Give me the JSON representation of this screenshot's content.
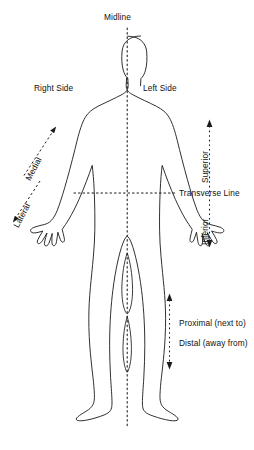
{
  "diagram": {
    "labels": {
      "midline": "Midline",
      "right_side": "Right Side",
      "left_side": "Left Side",
      "medial": "Medial",
      "lateral": "Lateral",
      "superior": "Superior",
      "inferior": "Inferior",
      "transverse_line": "Transverse Line",
      "proximal": "Proximal (next to)",
      "distal": "Distal (away from)"
    },
    "colors": {
      "outline": "#1a1a1a",
      "guide": "#1a1a1a",
      "background": "#ffffff"
    }
  }
}
